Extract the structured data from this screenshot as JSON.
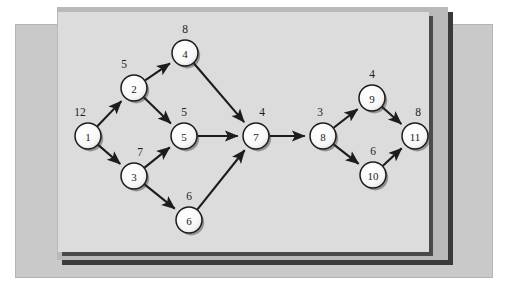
{
  "figure": {
    "type": "directed-graph",
    "caption": ""
  },
  "colors": {
    "page_background": "#ffffff",
    "backdrop_panel": "#c9c9c9",
    "dark_panel": "#b9b9b9",
    "inner_panel": "#dcdcdc",
    "shadow": "#3a3a3a",
    "node_fill": "#fbfbfb",
    "node_stroke": "#1c1c1c",
    "edge_stroke": "#1c1c1c",
    "text": "#1c1c1c"
  },
  "graph": {
    "nodes": [
      {
        "id": "1",
        "label": "1",
        "weight": "12",
        "cx": 30,
        "cy": 124,
        "r": 13,
        "wx": 22,
        "wy": 100
      },
      {
        "id": "2",
        "label": "2",
        "weight": "5",
        "cx": 76,
        "cy": 76,
        "r": 13,
        "wx": 66,
        "wy": 52
      },
      {
        "id": "3",
        "label": "3",
        "weight": "7",
        "cx": 76,
        "cy": 164,
        "r": 13,
        "wx": 82,
        "wy": 140
      },
      {
        "id": "4",
        "label": "4",
        "weight": "8",
        "cx": 127,
        "cy": 41,
        "r": 13,
        "wx": 127,
        "wy": 17
      },
      {
        "id": "5",
        "label": "5",
        "weight": "5",
        "cx": 126,
        "cy": 124,
        "r": 13,
        "wx": 126,
        "wy": 100
      },
      {
        "id": "6",
        "label": "6",
        "weight": "6",
        "cx": 131,
        "cy": 208,
        "r": 13,
        "wx": 131,
        "wy": 184
      },
      {
        "id": "7",
        "label": "7",
        "weight": "4",
        "cx": 198,
        "cy": 124,
        "r": 13,
        "wx": 204,
        "wy": 100
      },
      {
        "id": "8",
        "label": "8",
        "weight": "3",
        "cx": 265,
        "cy": 124,
        "r": 13,
        "wx": 262,
        "wy": 100
      },
      {
        "id": "9",
        "label": "9",
        "weight": "4",
        "cx": 314,
        "cy": 86,
        "r": 13,
        "wx": 314,
        "wy": 62
      },
      {
        "id": "10",
        "label": "10",
        "weight": "6",
        "cx": 315,
        "cy": 163,
        "r": 13,
        "wx": 315,
        "wy": 139
      },
      {
        "id": "11",
        "label": "11",
        "weight": "8",
        "cx": 357,
        "cy": 124,
        "r": 13,
        "wx": 360,
        "wy": 100
      }
    ],
    "edges": [
      {
        "from": "1",
        "to": "2"
      },
      {
        "from": "1",
        "to": "3"
      },
      {
        "from": "2",
        "to": "4"
      },
      {
        "from": "2",
        "to": "5"
      },
      {
        "from": "3",
        "to": "5"
      },
      {
        "from": "3",
        "to": "6"
      },
      {
        "from": "4",
        "to": "7"
      },
      {
        "from": "5",
        "to": "7"
      },
      {
        "from": "6",
        "to": "7"
      },
      {
        "from": "7",
        "to": "8"
      },
      {
        "from": "8",
        "to": "9"
      },
      {
        "from": "8",
        "to": "10"
      },
      {
        "from": "9",
        "to": "11"
      },
      {
        "from": "10",
        "to": "11"
      }
    ]
  },
  "bleed": {
    "text": "                                                                  \n                                                                  \n                                                                  \n                                                                  \n                                                                  \n                                                                  \n                                                                  \n                                                                  \n                                                                  \n                                                                  \n                                                                  \n                                                                  \n                                                                  \n"
  }
}
